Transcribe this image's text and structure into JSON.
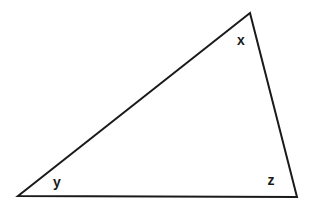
{
  "figure": {
    "type": "geometry-diagram",
    "shape": "triangle",
    "background_color": "#ffffff",
    "stroke_color": "#1a1a1a",
    "stroke_width": 2,
    "canvas": {
      "width": 313,
      "height": 210
    },
    "vertices": [
      {
        "id": "apex",
        "name": "top-vertex",
        "x": 250,
        "y": 13,
        "angle_label": "x"
      },
      {
        "id": "bottom_left",
        "name": "bottom-left-vertex",
        "x": 18,
        "y": 196,
        "angle_label": "y"
      },
      {
        "id": "bottom_right",
        "name": "bottom-right-vertex",
        "x": 297,
        "y": 197,
        "angle_label": "z"
      }
    ],
    "edges": [
      {
        "id": "hypotenuse",
        "name": "long-diagonal-side",
        "from": "bottom_left",
        "to": "apex"
      },
      {
        "id": "right_side",
        "name": "right-side",
        "from": "apex",
        "to": "bottom_right"
      },
      {
        "id": "base",
        "name": "base-side",
        "from": "bottom_right",
        "to": "bottom_left"
      }
    ],
    "labels": [
      {
        "id": "label_x",
        "text": "x",
        "x": 241,
        "y": 40,
        "font_size": 14
      },
      {
        "id": "label_y",
        "text": "y",
        "x": 57,
        "y": 182,
        "font_size": 14
      },
      {
        "id": "label_z",
        "text": "z",
        "x": 271,
        "y": 180,
        "font_size": 14
      }
    ]
  }
}
